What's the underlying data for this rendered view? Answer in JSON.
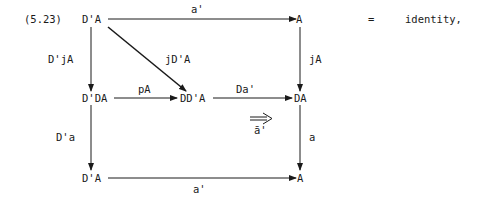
{
  "equation_number": "(5.23)",
  "nodes": {
    "top_left": "D'A",
    "top_right": "A",
    "mid_left": "D'DA",
    "mid_center": "DD'A",
    "mid_right": "DA",
    "bottom_left": "D'A",
    "bottom_right": "A"
  },
  "arrows": {
    "top": "a'",
    "diagonal": "jD'A",
    "left_upper": "D'jA",
    "right_upper": "jA",
    "mid_left": "pA",
    "mid_right": "Da'",
    "left_lower": "D'a",
    "right_lower": "a",
    "bottom": "a'",
    "two_cell": "ā'"
  },
  "equals_sign": "=",
  "result_text": "identity,",
  "colors": {
    "ink": "#1a1a1a",
    "background": "#ffffff"
  }
}
